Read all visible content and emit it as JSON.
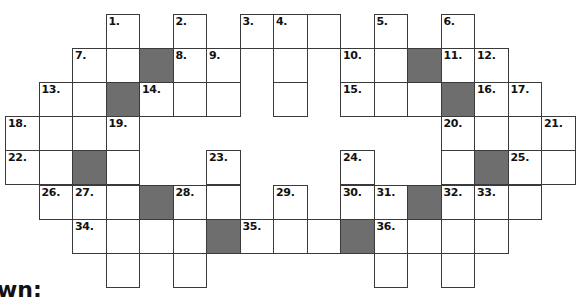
{
  "puzzle": {
    "section_label": "wn:",
    "colors": {
      "block": "#6e6e6e",
      "border": "#3a3a3a",
      "cell": "#ffffff"
    },
    "grid_origin": {
      "x": 5,
      "y": 14,
      "col_width": 33.5,
      "row_height": 34.1
    },
    "cells": [
      {
        "r": 0,
        "c": 3,
        "n": "1."
      },
      {
        "r": 0,
        "c": 5,
        "n": "2."
      },
      {
        "r": 0,
        "c": 7,
        "n": "3."
      },
      {
        "r": 0,
        "c": 8,
        "n": "4."
      },
      {
        "r": 0,
        "c": 9
      },
      {
        "r": 0,
        "c": 11,
        "n": "5."
      },
      {
        "r": 0,
        "c": 13,
        "n": "6."
      },
      {
        "r": 1,
        "c": 2,
        "n": "7."
      },
      {
        "r": 1,
        "c": 3
      },
      {
        "r": 1,
        "c": 4,
        "block": true
      },
      {
        "r": 1,
        "c": 5,
        "n": "8."
      },
      {
        "r": 1,
        "c": 6,
        "n": "9."
      },
      {
        "r": 1,
        "c": 8
      },
      {
        "r": 1,
        "c": 10,
        "n": "10."
      },
      {
        "r": 1,
        "c": 11
      },
      {
        "r": 1,
        "c": 12,
        "block": true
      },
      {
        "r": 1,
        "c": 13,
        "n": "11."
      },
      {
        "r": 1,
        "c": 14,
        "n": "12."
      },
      {
        "r": 2,
        "c": 1,
        "n": "13."
      },
      {
        "r": 2,
        "c": 2
      },
      {
        "r": 2,
        "c": 3,
        "block": true
      },
      {
        "r": 2,
        "c": 4,
        "n": "14."
      },
      {
        "r": 2,
        "c": 5
      },
      {
        "r": 2,
        "c": 6
      },
      {
        "r": 2,
        "c": 8
      },
      {
        "r": 2,
        "c": 10,
        "n": "15."
      },
      {
        "r": 2,
        "c": 11
      },
      {
        "r": 2,
        "c": 12
      },
      {
        "r": 2,
        "c": 13,
        "block": true
      },
      {
        "r": 2,
        "c": 14,
        "n": "16."
      },
      {
        "r": 2,
        "c": 15,
        "n": "17."
      },
      {
        "r": 3,
        "c": 0,
        "n": "18."
      },
      {
        "r": 3,
        "c": 1
      },
      {
        "r": 3,
        "c": 2
      },
      {
        "r": 3,
        "c": 3,
        "n": "19."
      },
      {
        "r": 3,
        "c": 13,
        "n": "20."
      },
      {
        "r": 3,
        "c": 14
      },
      {
        "r": 3,
        "c": 15
      },
      {
        "r": 3,
        "c": 16,
        "n": "21."
      },
      {
        "r": 4,
        "c": 0,
        "n": "22."
      },
      {
        "r": 4,
        "c": 1
      },
      {
        "r": 4,
        "c": 2,
        "block": true
      },
      {
        "r": 4,
        "c": 3
      },
      {
        "r": 4,
        "c": 6,
        "n": "23."
      },
      {
        "r": 4,
        "c": 10,
        "n": "24."
      },
      {
        "r": 4,
        "c": 13
      },
      {
        "r": 4,
        "c": 14,
        "block": true
      },
      {
        "r": 4,
        "c": 15,
        "n": "25."
      },
      {
        "r": 4,
        "c": 16
      },
      {
        "r": 5,
        "c": 1,
        "n": "26."
      },
      {
        "r": 5,
        "c": 2,
        "n": "27."
      },
      {
        "r": 5,
        "c": 3
      },
      {
        "r": 5,
        "c": 4,
        "block": true
      },
      {
        "r": 5,
        "c": 5,
        "n": "28."
      },
      {
        "r": 5,
        "c": 6
      },
      {
        "r": 5,
        "c": 8,
        "n": "29."
      },
      {
        "r": 5,
        "c": 10,
        "n": "30."
      },
      {
        "r": 5,
        "c": 11,
        "n": "31."
      },
      {
        "r": 5,
        "c": 12,
        "block": true
      },
      {
        "r": 5,
        "c": 13,
        "n": "32."
      },
      {
        "r": 5,
        "c": 14,
        "n": "33."
      },
      {
        "r": 5,
        "c": 15
      },
      {
        "r": 6,
        "c": 2,
        "n": "34."
      },
      {
        "r": 6,
        "c": 3
      },
      {
        "r": 6,
        "c": 4
      },
      {
        "r": 6,
        "c": 5
      },
      {
        "r": 6,
        "c": 6,
        "block": true
      },
      {
        "r": 6,
        "c": 7,
        "n": "35."
      },
      {
        "r": 6,
        "c": 8
      },
      {
        "r": 6,
        "c": 9
      },
      {
        "r": 6,
        "c": 10,
        "block": true
      },
      {
        "r": 6,
        "c": 11,
        "n": "36."
      },
      {
        "r": 6,
        "c": 12
      },
      {
        "r": 6,
        "c": 13
      },
      {
        "r": 6,
        "c": 14
      },
      {
        "r": 7,
        "c": 3
      },
      {
        "r": 7,
        "c": 5
      },
      {
        "r": 7,
        "c": 11
      },
      {
        "r": 7,
        "c": 13
      }
    ]
  }
}
